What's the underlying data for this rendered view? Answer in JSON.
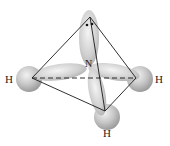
{
  "diagram": {
    "central_atom": "N",
    "atoms": [
      {
        "label": "H",
        "position": "left"
      },
      {
        "label": "H",
        "position": "right"
      },
      {
        "label": "H",
        "position": "bottom"
      }
    ],
    "lone_pair": {
      "position": "top",
      "dots": 2
    },
    "colors": {
      "orbital_fill": "#d4d4d4",
      "orbital_shade": "#9a9a9a",
      "edge_line": "#1a1a1a",
      "text": "#222222"
    }
  }
}
